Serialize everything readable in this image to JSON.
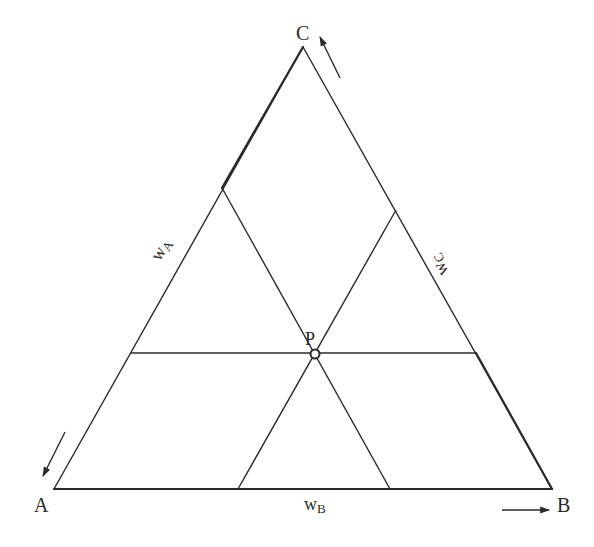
{
  "diagram": {
    "type": "ternary-diagram",
    "vertices": {
      "A": {
        "label": "A",
        "x": 54,
        "y": 489
      },
      "B": {
        "label": "B",
        "x": 552,
        "y": 489
      },
      "C": {
        "label": "C",
        "x": 303,
        "y": 47
      }
    },
    "point": {
      "label": "P",
      "x": 315,
      "y": 354
    },
    "axis_labels": {
      "wA": {
        "main": "w",
        "sub": "A"
      },
      "wB": {
        "main": "w",
        "sub": "B"
      },
      "wC": {
        "main": "w",
        "sub": "C"
      }
    },
    "guide_lines": [
      {
        "name": "horizontal-through-P",
        "x1": 131,
        "y1": 353,
        "x2": 476,
        "y2": 353
      },
      {
        "name": "parallel-to-AC-through-P",
        "x1": 222,
        "y1": 188,
        "x2": 390,
        "y2": 489
      },
      {
        "name": "parallel-to-BC-through-P",
        "x1": 396,
        "y1": 210,
        "x2": 238,
        "y2": 489
      }
    ],
    "colors": {
      "line": "#2a2a2a",
      "background": "#ffffff"
    }
  }
}
